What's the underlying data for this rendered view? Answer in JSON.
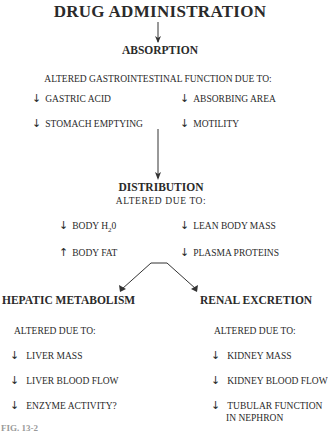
{
  "title": "DRUG ADMINISTRATION",
  "absorption": {
    "heading": "ABSORPTION",
    "subheading": "ALTERED GASTROINTESTINAL FUNCTION DUE TO:",
    "items": [
      {
        "dir": "↓",
        "label": "GASTRIC ACID"
      },
      {
        "dir": "↓",
        "label": "ABSORBING AREA"
      },
      {
        "dir": "↓",
        "label": "STOMACH EMPTYING"
      },
      {
        "dir": "↓",
        "label": "MOTILITY"
      }
    ]
  },
  "distribution": {
    "heading": "DISTRIBUTION",
    "subheading": "ALTERED DUE TO:",
    "items": [
      {
        "dir": "↓",
        "label": "BODY H",
        "sub": "2",
        "suffix": "0"
      },
      {
        "dir": "↓",
        "label": "LEAN BODY MASS"
      },
      {
        "dir": "↑",
        "label": "BODY FAT"
      },
      {
        "dir": "↓",
        "label": "PLASMA PROTEINS"
      }
    ]
  },
  "hepatic": {
    "heading": "HEPATIC METABOLISM",
    "subheading": "ALTERED DUE TO:",
    "items": [
      {
        "dir": "↓",
        "label": "LIVER MASS"
      },
      {
        "dir": "↓",
        "label": "LIVER BLOOD FLOW"
      },
      {
        "dir": "↓",
        "label": "ENZYME ACTIVITY?"
      }
    ]
  },
  "renal": {
    "heading": "RENAL EXCRETION",
    "subheading": "ALTERED DUE TO:",
    "items": [
      {
        "dir": "↓",
        "label": "KIDNEY MASS"
      },
      {
        "dir": "↓",
        "label": "KIDNEY BLOOD FLOW"
      },
      {
        "dir": "↓",
        "label": "TUBULAR FUNCTION",
        "line2": "IN NEPHRON"
      }
    ]
  },
  "caption": "FIG. 13-2"
}
